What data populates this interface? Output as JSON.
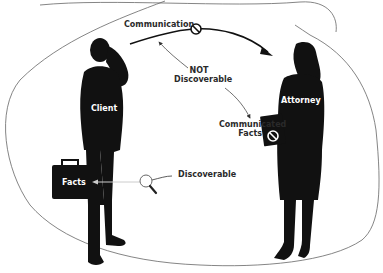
{
  "diagram": {
    "figures": {
      "client": {
        "label": "Client"
      },
      "attorney": {
        "label": "Attorney"
      }
    },
    "labels": {
      "communication": "Communication",
      "not_discoverable_line1": "NOT",
      "not_discoverable_line2": "Discoverable",
      "communicated_facts_line1": "Communicated",
      "communicated_facts_line2": "Facts",
      "facts": "Facts",
      "discoverable": "Discoverable"
    },
    "icons": {
      "prohibited": "prohibited-icon",
      "magnifier": "magnifying-glass-icon"
    },
    "colors": {
      "silhouette": "#111111",
      "text": "#2a2a2a",
      "boundary": "#555555",
      "background": "#ffffff"
    }
  }
}
